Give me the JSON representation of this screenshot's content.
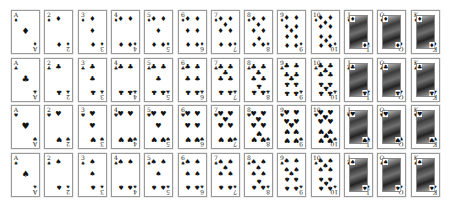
{
  "layout": {
    "origin_x": 11,
    "origin_y": 10,
    "col_pitch": 33.3,
    "row_pitch": 47.7,
    "card_w": 29,
    "card_h": 44
  },
  "ranks": [
    "A",
    "2",
    "3",
    "4",
    "5",
    "6",
    "7",
    "8",
    "9",
    "10",
    "J",
    "Q",
    "K"
  ],
  "rows": [
    {
      "suit": "diamonds",
      "symbol": "♦"
    },
    {
      "suit": "clubs",
      "symbol": "♣"
    },
    {
      "suit": "hearts",
      "symbol": "♥"
    },
    {
      "suit": "spades",
      "symbol": "♠"
    }
  ],
  "colors": {
    "ink": "#111111",
    "border": "#9a9a9a",
    "background": "#ffffff"
  },
  "pip_layouts": {
    "A": [
      [
        50,
        50
      ]
    ],
    "2": [
      [
        50,
        22
      ],
      [
        50,
        78
      ]
    ],
    "3": [
      [
        50,
        22
      ],
      [
        50,
        50
      ],
      [
        50,
        78
      ]
    ],
    "4": [
      [
        32,
        22
      ],
      [
        68,
        22
      ],
      [
        32,
        78
      ],
      [
        68,
        78
      ]
    ],
    "5": [
      [
        32,
        22
      ],
      [
        68,
        22
      ],
      [
        50,
        50
      ],
      [
        32,
        78
      ],
      [
        68,
        78
      ]
    ],
    "6": [
      [
        32,
        22
      ],
      [
        68,
        22
      ],
      [
        32,
        50
      ],
      [
        68,
        50
      ],
      [
        32,
        78
      ],
      [
        68,
        78
      ]
    ],
    "7": [
      [
        32,
        22
      ],
      [
        68,
        22
      ],
      [
        50,
        36
      ],
      [
        32,
        50
      ],
      [
        68,
        50
      ],
      [
        32,
        78
      ],
      [
        68,
        78
      ]
    ],
    "8": [
      [
        32,
        22
      ],
      [
        68,
        22
      ],
      [
        50,
        36
      ],
      [
        32,
        50
      ],
      [
        68,
        50
      ],
      [
        50,
        64
      ],
      [
        32,
        78
      ],
      [
        68,
        78
      ]
    ],
    "9": [
      [
        32,
        20
      ],
      [
        68,
        20
      ],
      [
        32,
        40
      ],
      [
        68,
        40
      ],
      [
        50,
        50
      ],
      [
        32,
        60
      ],
      [
        68,
        60
      ],
      [
        32,
        80
      ],
      [
        68,
        80
      ]
    ],
    "10": [
      [
        32,
        20
      ],
      [
        68,
        20
      ],
      [
        50,
        30
      ],
      [
        32,
        40
      ],
      [
        68,
        40
      ],
      [
        32,
        60
      ],
      [
        68,
        60
      ],
      [
        50,
        70
      ],
      [
        32,
        80
      ],
      [
        68,
        80
      ]
    ]
  }
}
